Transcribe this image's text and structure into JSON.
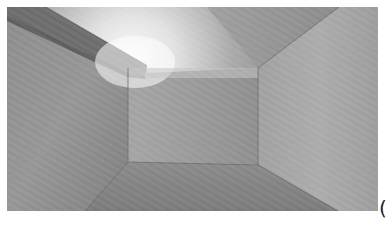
{
  "scene": {
    "description": "3D rendered empty room interior with a bright light near the top-left ceiling beam",
    "colors": {
      "ceiling_left": "#d8d8d8",
      "ceiling_right": "#8c8c8c",
      "back_wall": "#9a9a9a",
      "left_wall": "#8e8e8e",
      "right_wall": "#a6a6a6",
      "floor": "#828282",
      "beam": "#6e6e6e",
      "light": "#ffffff"
    }
  },
  "overlay": {
    "corner_glyph": "("
  }
}
